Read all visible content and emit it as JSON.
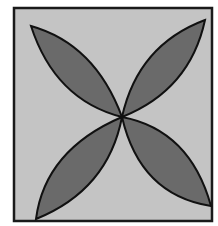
{
  "diagram": {
    "colors": {
      "background": "#ffffff",
      "square_fill": "#c4c4c4",
      "square_stroke": "#1a1a1a",
      "petal_fill": "#6a6a6a",
      "petal_stroke": "#111111"
    },
    "square": {
      "x": 14,
      "y": 8,
      "width": 198,
      "height": 213
    },
    "center": {
      "x": 122,
      "y": 117
    },
    "petals": [
      {
        "name": "top-left",
        "tip": [
          31,
          26
        ]
      },
      {
        "name": "top-right",
        "tip": [
          205,
          20
        ]
      },
      {
        "name": "bottom-left",
        "tip": [
          36,
          219
        ]
      },
      {
        "name": "bottom-right",
        "tip": [
          211,
          206
        ]
      }
    ]
  }
}
